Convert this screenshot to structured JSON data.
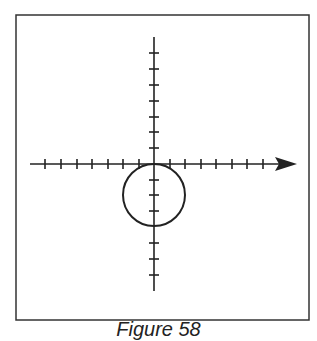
{
  "figure": {
    "caption": "Figure 58",
    "colors": {
      "ink": "#222222",
      "background": "#ffffff"
    }
  },
  "diagram": {
    "type": "coordinate-plane",
    "x_axis": {
      "ticks_left": 7,
      "ticks_right": 7,
      "arrow": "right"
    },
    "y_axis": {
      "ticks_up": 7,
      "ticks_down": 7,
      "arrow": "none"
    },
    "circle": {
      "center": [
        0,
        -2
      ],
      "radius": 2,
      "note": "circle tangent to x-axis at origin, below the axis"
    }
  }
}
